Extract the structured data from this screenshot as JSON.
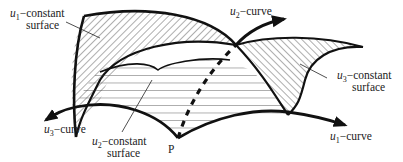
{
  "diagram": {
    "labels": {
      "u1_surface": {
        "var": "u",
        "sub": "1",
        "line1": "−constant",
        "line2": "surface"
      },
      "u2_surface": {
        "var": "u",
        "sub": "2",
        "line1": "−constant",
        "line2": "surface"
      },
      "u3_surface": {
        "var": "u",
        "sub": "3",
        "line1": "−constant",
        "line2": "surface"
      },
      "u1_curve": {
        "var": "u",
        "sub": "1",
        "text": "−curve"
      },
      "u2_curve": {
        "var": "u",
        "sub": "2",
        "text": "−curve"
      },
      "u3_curve": {
        "var": "u",
        "sub": "3",
        "text": "−curve"
      },
      "point": "P"
    },
    "colors": {
      "stroke": "#111111",
      "hatch": "#333333",
      "text": "#222222",
      "background": "#ffffff"
    }
  }
}
